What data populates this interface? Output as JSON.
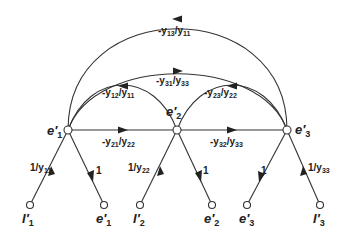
{
  "diagram": {
    "type": "signal-flow-graph",
    "nodes": {
      "e1p": {
        "label": "e",
        "prime": "′",
        "sub": "1",
        "x": 68,
        "y": 130
      },
      "e2p": {
        "label": "e",
        "prime": "′",
        "sub": "2",
        "x": 177,
        "y": 130
      },
      "e3p": {
        "label": "e",
        "prime": "′",
        "sub": "3",
        "x": 287,
        "y": 130
      }
    },
    "bottom_nodes": [
      {
        "label": "I",
        "prime": "′",
        "sub": "1",
        "x": 30
      },
      {
        "label": "e",
        "prime": "′",
        "sub": "1",
        "x": 104
      },
      {
        "label": "I",
        "prime": "′",
        "sub": "2",
        "x": 140
      },
      {
        "label": "e",
        "prime": "′",
        "sub": "2",
        "x": 212
      },
      {
        "label": "e",
        "prime": "′",
        "sub": "3",
        "x": 247
      },
      {
        "label": "I",
        "prime": "′",
        "sub": "3",
        "x": 320
      }
    ],
    "edges": {
      "y13_y11": {
        "pre": "-y",
        "a": "13",
        "mid": "/y",
        "b": "11"
      },
      "y31_y33": {
        "pre": "-y",
        "a": "31",
        "mid": "/y",
        "b": "33"
      },
      "y12_y11": {
        "pre": "-y",
        "a": "12",
        "mid": "/y",
        "b": "11"
      },
      "y23_y22": {
        "pre": "-y",
        "a": "23",
        "mid": "/y",
        "b": "22"
      },
      "y21_y22": {
        "pre": "-y",
        "a": "21",
        "mid": "/y",
        "b": "22"
      },
      "y32_y33": {
        "pre": "-y",
        "a": "32",
        "mid": "/y",
        "b": "33"
      },
      "inv_y11": {
        "pre": "1",
        "mid": "/y",
        "b": "11"
      },
      "inv_y22": {
        "pre": "1",
        "mid": "/y",
        "b": "22"
      },
      "inv_y33": {
        "pre": "1",
        "mid": "/y",
        "b": "33"
      },
      "one_1": "1",
      "one_2": "1",
      "one_3": "1"
    }
  }
}
